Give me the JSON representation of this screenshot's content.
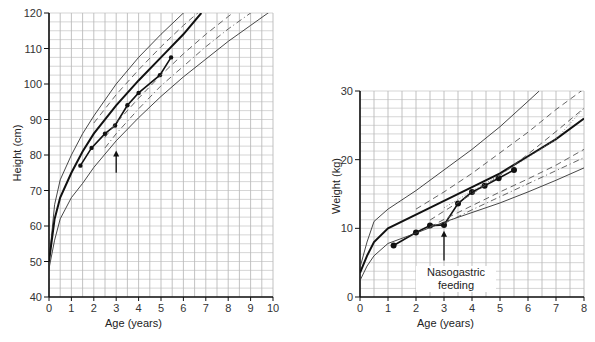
{
  "chart_data": [
    {
      "type": "line",
      "title": "",
      "xlabel": "Age (years)",
      "ylabel": "Height (cm)",
      "xlim": [
        0,
        10
      ],
      "ylim": [
        40,
        120
      ],
      "x_ticks": [
        "0",
        "1",
        "2",
        "3",
        "4",
        "5",
        "6",
        "7",
        "8",
        "9",
        "10"
      ],
      "y_ticks": [
        "40",
        "50",
        "60",
        "70",
        "80",
        "90",
        "100",
        "110",
        "120"
      ],
      "grid": true,
      "annotations": [
        {
          "type": "arrow",
          "x": 3,
          "from_y": 75,
          "to_y": 81
        }
      ],
      "series": [
        {
          "name": "patient height",
          "style": "bold line with points",
          "x": [
            1.4,
            1.9,
            2.5,
            2.95,
            3.5,
            4.0,
            4.95,
            5.45
          ],
          "y": [
            77,
            82,
            86,
            88.3,
            94,
            97.5,
            102.5,
            107.5
          ]
        },
        {
          "name": "upper centile (97th)",
          "style": "thin solid",
          "x": [
            0,
            0.25,
            0.5,
            1,
            1.5,
            2,
            3,
            4,
            5,
            6,
            6.5
          ],
          "y": [
            50,
            66,
            73,
            80,
            86,
            91,
            100,
            107.5,
            114,
            120,
            123
          ]
        },
        {
          "name": "50th centile",
          "style": "bold solid",
          "x": [
            0,
            0.25,
            0.5,
            1,
            1.5,
            2,
            3,
            4,
            5,
            6,
            6.8
          ],
          "y": [
            50,
            62,
            68,
            75,
            81,
            86,
            94,
            101,
            107.5,
            114,
            120
          ]
        },
        {
          "name": "lower centile (3rd)",
          "style": "thin solid",
          "x": [
            0,
            0.25,
            0.5,
            1,
            1.5,
            2,
            3,
            4,
            5,
            6,
            7,
            8,
            9,
            10
          ],
          "y": [
            48,
            56,
            62,
            68,
            72,
            76.5,
            84,
            90.5,
            96.5,
            102,
            107,
            112,
            116.5,
            121
          ]
        },
        {
          "name": "dashed centiles band",
          "style": "dashed",
          "x": [
            2,
            3,
            4,
            5,
            6,
            7,
            8
          ],
          "y": [
            89,
            97,
            104,
            110.5,
            116.5,
            122,
            127
          ]
        },
        {
          "name": "dashed centiles band 2",
          "style": "dashed",
          "x": [
            2.5,
            3,
            4,
            5,
            6,
            7,
            8,
            9
          ],
          "y": [
            85,
            89,
            96,
            102.5,
            108.5,
            114,
            119,
            124
          ]
        },
        {
          "name": "dash-dot centile",
          "style": "dash-dot",
          "x": [
            2.5,
            3,
            4,
            5,
            6,
            7,
            8,
            9,
            10
          ],
          "y": [
            82,
            86,
            93,
            99.5,
            105,
            110.5,
            115.5,
            120,
            124.5
          ]
        }
      ]
    },
    {
      "type": "line",
      "title": "",
      "xlabel": "Age (years)",
      "ylabel": "Weight (kg)",
      "xlim": [
        0,
        8
      ],
      "ylim": [
        0,
        30
      ],
      "x_ticks": [
        "0",
        "1",
        "2",
        "3",
        "4",
        "5",
        "6",
        "7",
        "8"
      ],
      "y_ticks": [
        "0",
        "10",
        "20",
        "30"
      ],
      "grid": true,
      "annotations": [
        {
          "type": "arrow",
          "x": 3,
          "from_y": 5.3,
          "to_y": 9.5,
          "text": "Nasogastric feeding"
        }
      ],
      "series": [
        {
          "name": "patient weight",
          "style": "bold line with points",
          "x": [
            1.2,
            2.0,
            2.5,
            3.0,
            3.5,
            4.0,
            4.45,
            4.95,
            5.5
          ],
          "y": [
            7.5,
            9.4,
            10.4,
            10.5,
            13.6,
            15.3,
            16.2,
            17.3,
            18.5
          ]
        },
        {
          "name": "upper centile (97th)",
          "style": "thin solid",
          "x": [
            0,
            0.25,
            0.5,
            1,
            2,
            3,
            4,
            5,
            6,
            6.4
          ],
          "y": [
            4.3,
            8,
            11,
            12.8,
            15.5,
            18.5,
            21.5,
            24.8,
            28.5,
            30
          ]
        },
        {
          "name": "50th centile",
          "style": "bold solid",
          "x": [
            0,
            0.25,
            0.5,
            1,
            2,
            3,
            4,
            5,
            6,
            7,
            8
          ],
          "y": [
            3.5,
            6,
            8,
            10,
            12,
            14,
            16,
            18,
            20.5,
            23,
            26
          ]
        },
        {
          "name": "lower centile (3rd)",
          "style": "thin solid",
          "x": [
            0,
            0.25,
            0.5,
            1,
            2,
            3,
            4,
            5,
            6,
            7,
            8
          ],
          "y": [
            2.4,
            4.5,
            6,
            7.8,
            9.3,
            10.9,
            12.3,
            13.7,
            15.3,
            17,
            18.8
          ]
        },
        {
          "name": "dashed centile upper",
          "style": "dashed",
          "x": [
            2,
            3,
            4,
            5,
            6,
            7,
            8
          ],
          "y": [
            12.8,
            15.3,
            18,
            21,
            24,
            27.3,
            30.3
          ]
        },
        {
          "name": "dashed centile",
          "style": "dashed",
          "x": [
            2.5,
            3,
            4,
            5,
            6,
            7,
            8
          ],
          "y": [
            11.2,
            12.5,
            15,
            17.7,
            20.8,
            24.1,
            27.5
          ]
        },
        {
          "name": "dotted centile",
          "style": "dotted",
          "x": [
            3,
            4,
            5,
            6,
            7,
            8
          ],
          "y": [
            13,
            15.4,
            17.8,
            20.3,
            23,
            27.5
          ]
        },
        {
          "name": "dashed centile lower",
          "style": "dashed",
          "x": [
            2.5,
            3,
            4,
            5,
            6,
            7,
            8
          ],
          "y": [
            10.2,
            11.3,
            13.3,
            15.3,
            17.2,
            19.2,
            21.5
          ]
        },
        {
          "name": "dash-dot centile lower",
          "style": "dash-dot",
          "x": [
            3,
            4,
            5,
            6,
            7,
            8
          ],
          "y": [
            10.7,
            12.7,
            14.6,
            16.5,
            18.4,
            20.3
          ]
        }
      ]
    }
  ],
  "left_chart": {
    "ylabel": "Height (cm)",
    "xlabel": "Age (years)"
  },
  "right_chart": {
    "ylabel": "Weight (kg)",
    "xlabel": "Age (years)",
    "annotation_line1": "Nasogastric",
    "annotation_line2": "feeding"
  }
}
